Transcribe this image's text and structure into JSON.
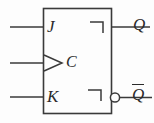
{
  "diagram": {
    "type": "logic-symbol",
    "stroke_color": "#3a3a3a",
    "background_color": "#fdfdfd",
    "text_color": "#2b2b2b",
    "body": {
      "shape": "rectangle",
      "x": 43,
      "y": 8,
      "width": 69,
      "height": 106
    },
    "inputs": [
      {
        "id": "j",
        "label": "J",
        "side": "left",
        "y": 27,
        "line_start_x": 10,
        "line_end_x": 43,
        "indicator": "none"
      },
      {
        "id": "c",
        "label": "C",
        "side": "left",
        "y": 63,
        "line_start_x": 10,
        "line_end_x": 43,
        "indicator": "dynamic-triangle"
      },
      {
        "id": "k",
        "label": "K",
        "side": "left",
        "y": 97,
        "line_start_x": 10,
        "line_end_x": 43,
        "indicator": "none"
      }
    ],
    "outputs": [
      {
        "id": "q",
        "label": "Q",
        "overbar": false,
        "side": "right",
        "y": 27,
        "line_start_x": 112,
        "line_end_x": 154,
        "indicator": "postponed-output-hook",
        "bubble": false
      },
      {
        "id": "q-bar",
        "label": "Q",
        "overbar": true,
        "side": "right",
        "y": 97,
        "line_start_x": 118,
        "line_end_x": 154,
        "indicator": "postponed-output-hook",
        "bubble": true,
        "bubble_cx": 114,
        "bubble_cy": 97,
        "bubble_r": 5
      }
    ]
  }
}
